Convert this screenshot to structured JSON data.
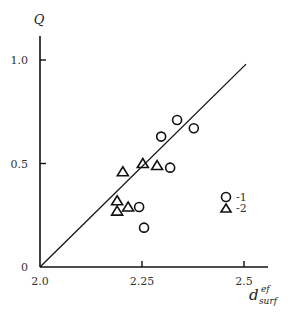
{
  "chart_data": {
    "type": "scatter",
    "title": "",
    "xlabel": "d",
    "xlabel_sup": "ef",
    "xlabel_sub": "surf",
    "ylabel": "Q",
    "xlim": [
      2.0,
      2.55
    ],
    "ylim": [
      0,
      1.05
    ],
    "x_ticks": [
      2.0,
      2.25,
      2.5
    ],
    "x_tick_labels": [
      "2.0",
      "2.25",
      "2.5"
    ],
    "y_ticks": [
      0,
      0.5,
      1.0
    ],
    "y_tick_labels": [
      "0",
      "0.5",
      "1.0"
    ],
    "grid": false,
    "legend_position": "right-middle",
    "series": [
      {
        "name": "-1",
        "marker": "circle",
        "points": [
          {
            "x": 2.336,
            "y": 0.71
          },
          {
            "x": 2.377,
            "y": 0.67
          },
          {
            "x": 2.297,
            "y": 0.63
          },
          {
            "x": 2.319,
            "y": 0.48
          },
          {
            "x": 2.243,
            "y": 0.29
          },
          {
            "x": 2.255,
            "y": 0.19
          }
        ]
      },
      {
        "name": "-2",
        "marker": "triangle",
        "points": [
          {
            "x": 2.203,
            "y": 0.46
          },
          {
            "x": 2.252,
            "y": 0.5
          },
          {
            "x": 2.287,
            "y": 0.49
          },
          {
            "x": 2.189,
            "y": 0.32
          },
          {
            "x": 2.189,
            "y": 0.27
          },
          {
            "x": 2.216,
            "y": 0.29
          }
        ]
      }
    ],
    "reference_line": {
      "x1": 2.0,
      "y1": 0.0,
      "x2": 2.505,
      "y2": 0.98,
      "label": "Q = 2(d - 2)"
    }
  }
}
